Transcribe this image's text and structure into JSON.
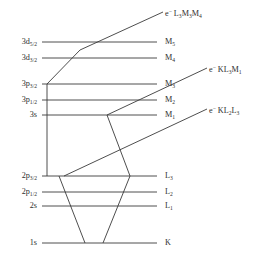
{
  "figure": {
    "background_color": "#ffffff",
    "line_color": "#3a3a3a",
    "text_color": "#2e2e2e"
  },
  "levels": [
    {
      "id": "3d52",
      "left_label": "3d",
      "left_sub": "5/2",
      "right_label": "M",
      "right_sub": "5",
      "y": 42,
      "x1": 42,
      "x2": 157
    },
    {
      "id": "3d32",
      "left_label": "3d",
      "left_sub": "3/2",
      "right_label": "M",
      "right_sub": "4",
      "y": 58,
      "x1": 42,
      "x2": 157
    },
    {
      "id": "3p32",
      "left_label": "3p",
      "left_sub": "3/2",
      "right_label": "M",
      "right_sub": "3",
      "y": 84,
      "x1": 42,
      "x2": 157
    },
    {
      "id": "3p12",
      "left_label": "3p",
      "left_sub": "1/2",
      "right_label": "M",
      "right_sub": "2",
      "y": 100,
      "x1": 42,
      "x2": 157
    },
    {
      "id": "3s",
      "left_label": "3s",
      "left_sub": "",
      "right_label": "M",
      "right_sub": "1",
      "y": 115,
      "x1": 42,
      "x2": 157
    },
    {
      "id": "2p32",
      "left_label": "2p",
      "left_sub": "3/2",
      "right_label": "L",
      "right_sub": "3",
      "y": 176,
      "x1": 42,
      "x2": 157
    },
    {
      "id": "2p12",
      "left_label": "2p",
      "left_sub": "1/2",
      "right_label": "L",
      "right_sub": "2",
      "y": 192,
      "x1": 42,
      "x2": 157
    },
    {
      "id": "2s",
      "left_label": "2s",
      "left_sub": "",
      "right_label": "L",
      "right_sub": "1",
      "y": 206,
      "x1": 42,
      "x2": 157
    },
    {
      "id": "1s",
      "left_label": "1s",
      "left_sub": "",
      "right_label": "K",
      "right_sub": "",
      "y": 243,
      "x1": 42,
      "x2": 157
    }
  ],
  "annotations": [
    {
      "id": "auger-l3m3m4",
      "e_symbol": "e",
      "charge": "−",
      "transition": "L",
      "parts": [
        [
          "L",
          "3"
        ],
        [
          "M",
          "3"
        ],
        [
          "M",
          "4"
        ]
      ],
      "x": 165,
      "y": 14
    },
    {
      "id": "auger-kl3m1",
      "e_symbol": "e",
      "charge": "−",
      "transition": "K",
      "parts": [
        [
          "K",
          ""
        ],
        [
          "L",
          "3"
        ],
        [
          "M",
          "1"
        ]
      ],
      "x": 209,
      "y": 70
    },
    {
      "id": "auger-kl2l3",
      "e_symbol": "e",
      "charge": "−",
      "transition": "K",
      "parts": [
        [
          "K",
          ""
        ],
        [
          "L",
          "2"
        ],
        [
          "L",
          "3"
        ]
      ],
      "x": 209,
      "y": 111
    }
  ],
  "paths": {
    "vertical_connector": "M 47 84 L 47 176",
    "auger_l3m3m4_path": "M 47 84 L 80 50 L 163 12",
    "auger_kl3m1_path": "M 107 115 L 207 68",
    "auger_kl2l3_path": "M 64 176 L 207 109",
    "k_to_l_left": "M 59 176 L 85 243",
    "k_to_l_right": "M 130 176 L 103 243",
    "m1_to_l3": "M 107 115 L 130 176"
  },
  "labels": {
    "superscript_minus": "−"
  }
}
